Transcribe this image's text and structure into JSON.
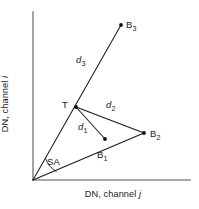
{
  "figure": {
    "type": "diagram",
    "axes": {
      "y_label_prefix": "DN, channel ",
      "y_label_symbol": "i",
      "x_label_prefix": "DN, channel ",
      "x_label_symbol": "j",
      "origin": {
        "x": 33,
        "y": 180
      },
      "y_axis_top": {
        "x": 33,
        "y": 12
      },
      "x_axis_right": {
        "x": 190,
        "y": 180
      }
    },
    "points": [
      {
        "id": "T",
        "label": "T",
        "sub": "",
        "x": 76,
        "y": 107
      },
      {
        "id": "B1",
        "label": "B",
        "sub": "1",
        "x": 105,
        "y": 139
      },
      {
        "id": "B2",
        "label": "B",
        "sub": "2",
        "x": 144,
        "y": 133
      },
      {
        "id": "B3",
        "label": "B",
        "sub": "3",
        "x": 121,
        "y": 25
      }
    ],
    "distances": [
      {
        "id": "d1",
        "label": "d",
        "sub": "1",
        "from": "T",
        "to": "B1"
      },
      {
        "id": "d2",
        "label": "d",
        "sub": "2",
        "from": "T",
        "to": "B2"
      },
      {
        "id": "d3",
        "label": "d",
        "sub": "3",
        "from": "T",
        "to": "B3"
      }
    ],
    "angle": {
      "id": "SA",
      "label": "SA",
      "description": "spectral angle at origin between ray to T/B3 and ray to B1/B2"
    },
    "rays": [
      {
        "id": "ray-origin-b3",
        "from": {
          "x": 33,
          "y": 180
        },
        "to": {
          "x": 121,
          "y": 25
        }
      },
      {
        "id": "ray-origin-b2",
        "from": {
          "x": 33,
          "y": 180
        },
        "to": {
          "x": 144,
          "y": 133
        }
      }
    ],
    "segments": [
      {
        "id": "seg-t-b1",
        "from": {
          "x": 76,
          "y": 107
        },
        "to": {
          "x": 105,
          "y": 139
        }
      },
      {
        "id": "seg-t-b2",
        "from": {
          "x": 76,
          "y": 107
        },
        "to": {
          "x": 144,
          "y": 133
        }
      }
    ],
    "colors": {
      "axis": "#8c8c8c",
      "line": "#1a1a1a",
      "text": "#1a1a1a",
      "background": "#ffffff"
    }
  }
}
